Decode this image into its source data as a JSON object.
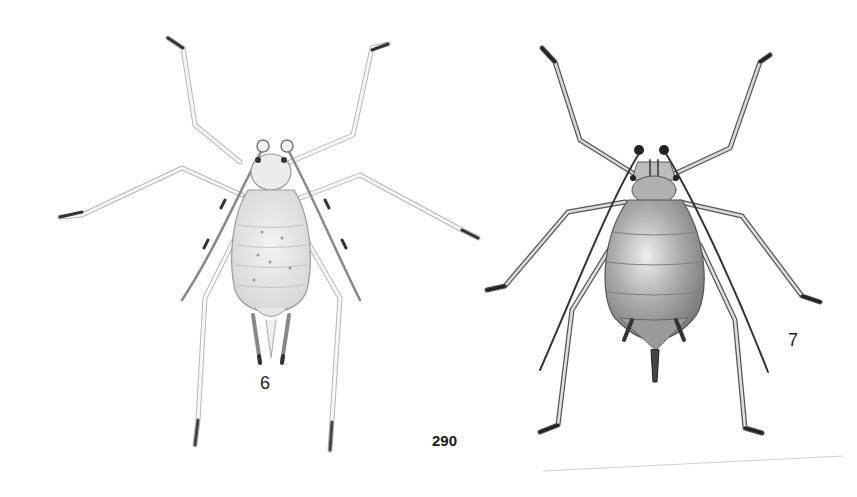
{
  "plate": {
    "figures": [
      {
        "id": "fig-6",
        "label": "6",
        "description": "pale aphid, dorsal view, light speckled body, long legs and antennae"
      },
      {
        "id": "fig-7",
        "label": "7",
        "description": "dark shaded aphid, dorsal view, rounded abdomen, siphunculi and cauda"
      }
    ],
    "page_number": "290"
  }
}
